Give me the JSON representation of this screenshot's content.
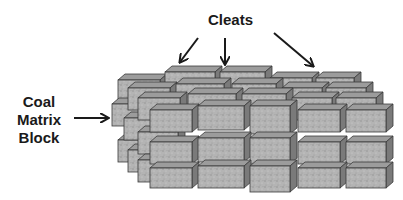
{
  "labels": {
    "cleats": "Cleats",
    "coal_line1": "Coal",
    "coal_line2": "Matrix",
    "coal_line3": "Block"
  },
  "colors": {
    "front": "#b4b4b4",
    "top": "#9c9c9c",
    "side": "#7a7a7a",
    "stroke": "#3a3a3a",
    "arrow": "#1a1a1a"
  },
  "arrows": [
    {
      "name": "cleats-arrow-left",
      "x1": 198,
      "y1": 38,
      "x2": 180,
      "y2": 62
    },
    {
      "name": "cleats-arrow-middle",
      "x1": 225,
      "y1": 38,
      "x2": 225,
      "y2": 64
    },
    {
      "name": "cleats-arrow-right",
      "x1": 274,
      "y1": 33,
      "x2": 313,
      "y2": 66
    },
    {
      "name": "coal-matrix-arrow",
      "x1": 74,
      "y1": 118,
      "x2": 108,
      "y2": 118
    }
  ],
  "blocks": [
    {
      "x": 118,
      "y": 80,
      "w": 42,
      "h": 22
    },
    {
      "x": 165,
      "y": 72,
      "w": 50,
      "h": 22
    },
    {
      "x": 220,
      "y": 72,
      "w": 45,
      "h": 22
    },
    {
      "x": 270,
      "y": 78,
      "w": 42,
      "h": 22
    },
    {
      "x": 316,
      "y": 78,
      "w": 38,
      "h": 22
    },
    {
      "x": 112,
      "y": 104,
      "w": 30,
      "h": 22
    },
    {
      "x": 118,
      "y": 140,
      "w": 40,
      "h": 22
    },
    {
      "x": 128,
      "y": 88,
      "w": 42,
      "h": 22
    },
    {
      "x": 176,
      "y": 84,
      "w": 48,
      "h": 22
    },
    {
      "x": 232,
      "y": 84,
      "w": 44,
      "h": 22
    },
    {
      "x": 282,
      "y": 88,
      "w": 40,
      "h": 22
    },
    {
      "x": 326,
      "y": 88,
      "w": 40,
      "h": 22
    },
    {
      "x": 124,
      "y": 118,
      "w": 40,
      "h": 22
    },
    {
      "x": 128,
      "y": 150,
      "w": 40,
      "h": 22
    },
    {
      "x": 138,
      "y": 98,
      "w": 42,
      "h": 22
    },
    {
      "x": 188,
      "y": 94,
      "w": 48,
      "h": 22
    },
    {
      "x": 242,
      "y": 94,
      "w": 44,
      "h": 22
    },
    {
      "x": 292,
      "y": 98,
      "w": 40,
      "h": 22
    },
    {
      "x": 336,
      "y": 98,
      "w": 40,
      "h": 22
    },
    {
      "x": 138,
      "y": 132,
      "w": 40,
      "h": 22
    },
    {
      "x": 138,
      "y": 160,
      "w": 40,
      "h": 22
    },
    {
      "x": 150,
      "y": 110,
      "w": 42,
      "h": 22
    },
    {
      "x": 198,
      "y": 106,
      "w": 46,
      "h": 24
    },
    {
      "x": 250,
      "y": 106,
      "w": 40,
      "h": 28
    },
    {
      "x": 298,
      "y": 110,
      "w": 42,
      "h": 22
    },
    {
      "x": 346,
      "y": 110,
      "w": 40,
      "h": 22
    },
    {
      "x": 150,
      "y": 142,
      "w": 42,
      "h": 22
    },
    {
      "x": 198,
      "y": 138,
      "w": 46,
      "h": 24
    },
    {
      "x": 250,
      "y": 138,
      "w": 40,
      "h": 26
    },
    {
      "x": 298,
      "y": 142,
      "w": 42,
      "h": 22
    },
    {
      "x": 346,
      "y": 142,
      "w": 40,
      "h": 22
    },
    {
      "x": 150,
      "y": 168,
      "w": 42,
      "h": 20
    },
    {
      "x": 198,
      "y": 166,
      "w": 46,
      "h": 22
    },
    {
      "x": 250,
      "y": 166,
      "w": 40,
      "h": 26
    },
    {
      "x": 298,
      "y": 168,
      "w": 42,
      "h": 20
    },
    {
      "x": 346,
      "y": 168,
      "w": 40,
      "h": 20
    }
  ],
  "depth": {
    "dx": 7,
    "dy": 6
  }
}
